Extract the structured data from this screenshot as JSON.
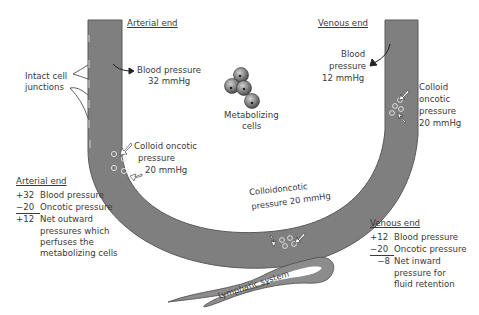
{
  "diagram": {
    "colors": {
      "vessel_fill": "#7f7f7f",
      "vessel_edge": "#5a5a5a",
      "text": "#3a3a3a",
      "cell_fill": "#8a8a8a",
      "lymph_fill": "#8c8c8c"
    },
    "labels": {
      "arterial_end": "Arterial end",
      "venous_end": "Venous end",
      "intact_junctions_line1": "Intact cell",
      "intact_junctions_line2": "junctions",
      "arterial_bp_line1": "Blood pressure",
      "arterial_bp_line2": "32 mmHg",
      "venous_bp_line1": "Blood",
      "venous_bp_line2": "pressure",
      "venous_bp_line3": "12 mmHg",
      "metabolizing_line1": "Metabolizing",
      "metabolizing_line2": "cells",
      "colloid_left_line1": "Colloid oncotic",
      "colloid_left_line2": "pressure",
      "colloid_left_line3": "20 mmHg",
      "colloid_right_line1": "Colloid",
      "colloid_right_line2": "oncotic",
      "colloid_right_line3": "pressure",
      "colloid_right_line4": "20 mmHg",
      "colloid_bottom_line1": "Colloidoncotic",
      "colloid_bottom_line2": "pressure 20 mmHg",
      "lymphatic": "Lymphatic system"
    },
    "arterial_calc": {
      "heading": "Arterial end",
      "rows": [
        {
          "value": "+32",
          "label": "Blood pressure"
        },
        {
          "value": "−20",
          "label": "Oncotic pressure"
        },
        {
          "value": "+12",
          "label": "Net outward"
        }
      ],
      "continuation": [
        "pressures which",
        "perfuses the",
        "metabolizing cells"
      ]
    },
    "venous_calc": {
      "heading": "Venous end",
      "rows": [
        {
          "value": "+12",
          "label": "Blood pressure"
        },
        {
          "value": "−20",
          "label": "Oncotic pressure"
        },
        {
          "value": "−8",
          "label": "Net inward"
        }
      ],
      "continuation": [
        "pressure for",
        "fluid retention"
      ]
    }
  }
}
